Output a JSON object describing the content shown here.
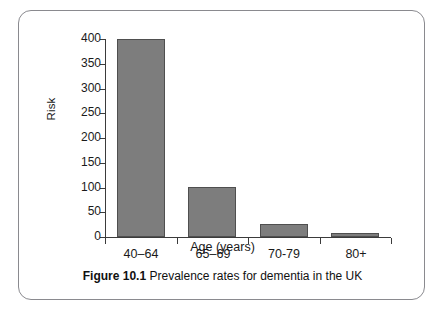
{
  "figure": {
    "caption_label": "Figure 10.1",
    "caption_text": "Prevalence rates for dementia in the UK"
  },
  "chart_data": {
    "type": "bar",
    "title": "",
    "subtitle": "",
    "xlabel": "Age (years)",
    "ylabel": "Risk",
    "categories": [
      "40–64",
      "65–69",
      "70-79",
      "80+"
    ],
    "values": [
      400,
      101,
      26,
      8
    ],
    "ylim": [
      0,
      400
    ],
    "ytick_labels": [
      "0",
      "50",
      "100",
      "150",
      "200",
      "250",
      "300",
      "350",
      "400"
    ],
    "ytick_values": [
      0,
      50,
      100,
      150,
      200,
      250,
      300,
      350,
      400
    ],
    "grid": false,
    "legend": "none",
    "bar_color": "#7d7d7d",
    "bar_edge_color": "#4f4f4f",
    "axis_color": "#3b3b3b",
    "background_color": "#ffffff"
  }
}
